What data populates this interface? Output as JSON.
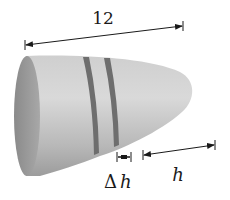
{
  "figure": {
    "type": "bullet-shaped solid of revolution with dimension annotations",
    "colors": {
      "background": "#ffffff",
      "body_light": "#d4d4d4",
      "body_mid": "#bdbdbd",
      "body_dark": "#8e8e8e",
      "face": "#9a9a9a",
      "band": "#6e6e6e",
      "ink": "#1a1a1a"
    }
  },
  "labels": {
    "total_length": "12",
    "delta_h": "Δ h",
    "h": "h"
  },
  "dimensions": {
    "total_length": {
      "label": "12",
      "from": [
        25,
        45
      ],
      "to": [
        183,
        26
      ]
    },
    "delta_h": {
      "label": "Δ h",
      "from": [
        117,
        157
      ],
      "to": [
        131,
        157
      ]
    },
    "h": {
      "label": "h",
      "from": [
        143,
        155
      ],
      "to": [
        215,
        145
      ]
    }
  }
}
